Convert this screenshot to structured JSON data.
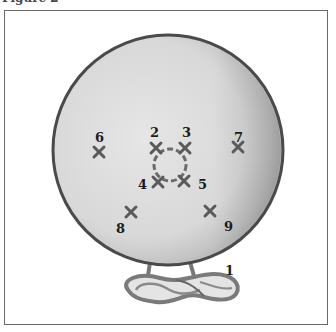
{
  "caption": "Figure 2",
  "diagram": {
    "colors": {
      "disc_fill": "#dcdcdc",
      "disc_outline": "#4a4a4a",
      "shade": "#b8b8b8",
      "marker": "#5a5a5a",
      "label": "#1c1c1c"
    },
    "markers": [
      {
        "id": "1",
        "label": "1"
      },
      {
        "id": "2",
        "label": "2"
      },
      {
        "id": "3",
        "label": "3"
      },
      {
        "id": "4",
        "label": "4"
      },
      {
        "id": "5",
        "label": "5"
      },
      {
        "id": "6",
        "label": "6"
      },
      {
        "id": "7",
        "label": "7"
      },
      {
        "id": "8",
        "label": "8"
      },
      {
        "id": "9",
        "label": "9"
      }
    ]
  }
}
